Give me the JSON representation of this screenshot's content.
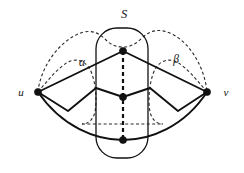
{
  "figure": {
    "type": "graph-diagram",
    "labels": {
      "u": "u",
      "v": "v",
      "separator": "S",
      "alpha": "α",
      "beta": "β"
    },
    "colors": {
      "ink": "#111111",
      "dashed_ink": "#2a2a2a",
      "background": "#ffffff"
    },
    "vertices": [
      {
        "name": "u",
        "x": 38,
        "y": 92,
        "label": "u",
        "label_x": 21,
        "label_y": 96
      },
      {
        "name": "v",
        "x": 207,
        "y": 92,
        "label": "v",
        "label_x": 226,
        "label_y": 96
      },
      {
        "name": "s-top",
        "x": 123,
        "y": 51,
        "label": "",
        "label_x": 0,
        "label_y": 0
      },
      {
        "name": "s-middle",
        "x": 123,
        "y": 97,
        "label": "",
        "label_x": 0,
        "label_y": 0
      },
      {
        "name": "s-bottom",
        "x": 123,
        "y": 140,
        "label": "",
        "label_x": 0,
        "label_y": 0
      }
    ],
    "label_positions": {
      "S": {
        "x": 124,
        "y": 18
      },
      "alpha": {
        "x": 82,
        "y": 66
      },
      "beta": {
        "x": 176,
        "y": 63
      }
    },
    "separator_box": {
      "x": 96,
      "y": 28,
      "width": 52,
      "height": 130,
      "radius": 21
    },
    "counts": {
      "vertices": 5,
      "labelled_vertices": 2,
      "dashed_regions": 3
    }
  }
}
